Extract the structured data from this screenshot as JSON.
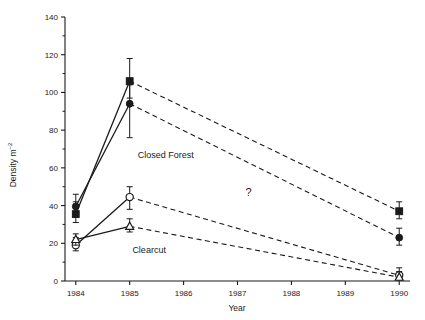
{
  "chart_data": {
    "type": "line",
    "title": "",
    "xlabel": "Year",
    "ylabel": "Density m",
    "ylabel_superscript": "-2",
    "ylabel_full": "Density m-2",
    "x": [
      1984,
      1985,
      1990
    ],
    "xlim": [
      1983.8,
      1990.2
    ],
    "ylim": [
      0,
      140
    ],
    "yticks": [
      0,
      20,
      40,
      60,
      80,
      100,
      120,
      140
    ],
    "ytick_labels": [
      "0",
      "20",
      "40",
      "60",
      "80",
      "100",
      "120",
      "140"
    ],
    "xticks": [
      1984,
      1985,
      1986,
      1987,
      1988,
      1989,
      1990
    ],
    "xtick_labels": [
      "1984",
      "1985",
      "1986",
      "1987",
      "1988",
      "1989",
      "1990"
    ],
    "grid": false,
    "legend": "none",
    "annotations": [
      {
        "text": "Closed Forest",
        "x": 1985.15,
        "y": 65
      },
      {
        "text": "Clearcut",
        "x": 1985.05,
        "y": 15
      },
      {
        "text": "?",
        "x": 1987.15,
        "y": 45
      }
    ],
    "series": [
      {
        "name": "Closed Forest - filled square",
        "marker": "filled-square",
        "line_segments": [
          "solid",
          "dashed"
        ],
        "x": [
          1984,
          1985,
          1990
        ],
        "values": [
          35.5,
          106,
          37
        ],
        "err_upper": [
          42,
          118,
          42
        ],
        "err_lower": [
          31,
          97,
          33
        ]
      },
      {
        "name": "Closed Forest - filled circle",
        "marker": "filled-circle",
        "line_segments": [
          "solid",
          "dashed"
        ],
        "x": [
          1984,
          1985,
          1990
        ],
        "values": [
          39.5,
          94,
          23
        ],
        "err_upper": [
          46,
          104,
          28
        ],
        "err_lower": [
          35,
          76,
          19
        ]
      },
      {
        "name": "Clearcut - open circle",
        "marker": "open-circle",
        "line_segments": [
          "solid",
          "dashed"
        ],
        "x": [
          1984,
          1985,
          1990
        ],
        "values": [
          19,
          44.5,
          3
        ],
        "err_upper": [
          23,
          50,
          7
        ],
        "err_lower": [
          16,
          38,
          1
        ]
      },
      {
        "name": "Clearcut - open triangle",
        "marker": "open-triangle",
        "line_segments": [
          "solid",
          "dashed"
        ],
        "x": [
          1984,
          1985,
          1990
        ],
        "values": [
          22,
          29,
          2
        ],
        "err_upper": [
          25,
          33,
          5
        ],
        "err_lower": [
          19,
          26,
          0.5
        ]
      }
    ],
    "colors": {
      "ink": "#1a1a1a",
      "background": "#ffffff"
    }
  }
}
